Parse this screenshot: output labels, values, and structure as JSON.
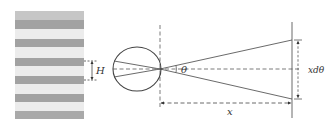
{
  "figure": {
    "left_panel": {
      "description": "grating of alternating gray stripes",
      "stripe_count_dark": 6,
      "period_label": "H",
      "colors": {
        "dark": "#a3a3a3",
        "light": "#e9e9e9",
        "top": "#c4c4c4"
      }
    },
    "right_panel": {
      "description": "eye viewing grating at distance x",
      "angle_label": "θ",
      "distance_label": "x",
      "height_label": "xdθ",
      "line_color": "#555555"
    }
  }
}
